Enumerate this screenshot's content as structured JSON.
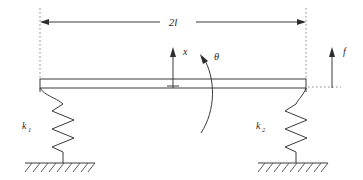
{
  "figure": {
    "type": "engineering-free-body-diagram",
    "background_color": "#ffffff",
    "line_color": "#3a3a3a",
    "dashed_line_color": "#8d8d8d"
  },
  "labels": {
    "span_dimension": "2l",
    "displacement": "x",
    "rotation": "θ",
    "force": "f",
    "spring_left_base": "k",
    "spring_left_sub": "1",
    "spring_right_base": "k",
    "spring_right_sub": "2"
  },
  "geometry": {
    "beam": {
      "x_left": 40,
      "x_right": 306,
      "y_top": 79,
      "y_bottom": 88,
      "label": "rigid beam"
    },
    "span_arrow": {
      "y": 22,
      "x_start": 40,
      "x_end": 306,
      "label": "2l"
    },
    "extension_line_left": {
      "x": 40,
      "y_top": 8,
      "y_bottom": 78
    },
    "extension_line_right": {
      "x": 306,
      "y_top": 8,
      "y_bottom": 78
    },
    "x_arrow": {
      "x": 173,
      "y_base": 88,
      "y_tip": 48,
      "direction": "up"
    },
    "f_arrow": {
      "x": 332,
      "y_base": 88,
      "y_tip": 48,
      "direction": "up"
    },
    "f_datum_dash": {
      "y": 87,
      "x_start": 308,
      "x_end": 340
    },
    "theta_arc": {
      "center_x": 200,
      "top_y": 55,
      "bottom_y": 133,
      "bulge": "right",
      "arrow_at": "top"
    },
    "spring_left": {
      "x": 63,
      "y_top": 88,
      "y_bottom": 163,
      "coils": 5
    },
    "spring_right": {
      "x": 296,
      "y_top": 88,
      "y_bottom": 163,
      "coils": 5
    },
    "ground_left": {
      "y": 163,
      "x_start": 25,
      "x_end": 95
    },
    "ground_right": {
      "y": 163,
      "x_start": 258,
      "x_end": 328
    }
  }
}
